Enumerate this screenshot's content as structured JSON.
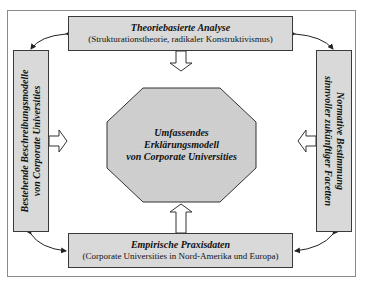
{
  "diagram": {
    "top_box": {
      "title": "Theoriebasierte Analyse",
      "subtitle": "(Strukturationstheorie, radikaler Konstruktivismus)"
    },
    "bottom_box": {
      "title": "Empirische Praxisdaten",
      "subtitle": "(Corporate Universities in Nord-Amerika und Europa)"
    },
    "left_box": {
      "line1": "Bestehende Beschreibungsmodelle",
      "line2": "von Corporate Universities"
    },
    "right_box": {
      "line1": "Normative Bestimmung",
      "line2": "sinnvoller zukünftiger Facetten"
    },
    "center": {
      "line1": "Umfassendes",
      "line2": "Erklärungsmodell",
      "line3": "von Corporate Universities"
    },
    "colors": {
      "box_fill": "#d9d9d9",
      "border": "#3a3a3a",
      "frame": "#8a8a8a"
    }
  }
}
